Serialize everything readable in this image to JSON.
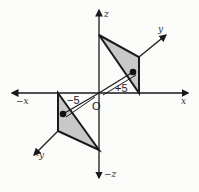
{
  "diagram": {
    "axes": {
      "x_pos": "x",
      "x_neg": "−x",
      "y_pos": "y",
      "y_neg": "-y",
      "z_pos": "z",
      "z_neg": "−z",
      "origin": "O"
    },
    "annotations": {
      "plus_five": "+5",
      "minus_five": "−5"
    },
    "colors": {
      "line": "#1a1a1a",
      "shade": "#c8c8c8",
      "background": "#fbfbfa"
    }
  }
}
